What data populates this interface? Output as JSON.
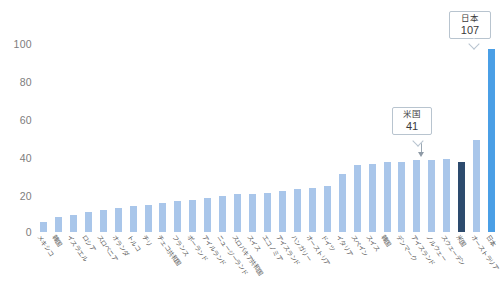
{
  "chart_data": {
    "type": "bar",
    "title": "",
    "subtitle": "",
    "xlabel": "",
    "ylabel": "",
    "ylim": [
      0,
      110
    ],
    "yticks": [
      0,
      20,
      40,
      60,
      80,
      100
    ],
    "grid": false,
    "legend": null,
    "categories": [
      "メキシコ",
      "韓国",
      "イスラエル",
      "ロシア",
      "スロベニア",
      "オランダ",
      "トルコ",
      "チリ",
      "チェコ共和国",
      "フランス",
      "ポーランド",
      "アイルランド",
      "ニュージーランド",
      "スロバキア共和国",
      "スイス",
      "エコノミア",
      "アイスランド",
      "ハンガリー",
      "オーストリア",
      "ドイツ",
      "イタリア",
      "スペイン",
      "スイス",
      "韓国",
      "デンマーク",
      "アイスランド",
      "ノルウェー",
      "スウェーデン",
      "米国",
      "オーストラリア",
      "日本"
    ],
    "values": [
      6,
      9,
      10,
      12,
      13,
      14,
      15,
      16,
      17,
      18,
      19,
      20,
      21,
      22,
      22,
      23,
      24,
      25,
      26,
      27,
      34,
      39,
      40,
      41,
      41,
      42,
      42,
      43,
      41,
      54,
      107
    ],
    "highlights": [
      {
        "index": 28,
        "label": "米国",
        "value": 107,
        "color": "#2d4b6e"
      },
      {
        "index": 30,
        "label": "日本",
        "value": 107,
        "color": "#4a9fe6"
      }
    ],
    "bar_color": "#a9c6ea"
  },
  "axis": {
    "y_ticks": [
      "100",
      "80",
      "60",
      "40",
      "20",
      "0"
    ]
  },
  "callouts": {
    "us": {
      "name": "米国",
      "value": "41"
    },
    "japan": {
      "name": "日本",
      "value": "107"
    }
  },
  "colors": {
    "bar_default": "#a9c6ea",
    "bar_us": "#2d4b6e",
    "bar_japan": "#4a9fe6",
    "tick_text": "#7d7d7d",
    "label_text": "#5a5a5a",
    "callout_border": "#b8c4cf"
  }
}
